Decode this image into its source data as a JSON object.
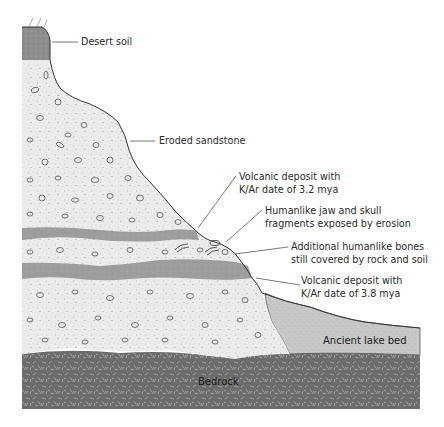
{
  "diagram": {
    "colors": {
      "desert_soil": "#8c8c8c",
      "sandstone": "#e8e8e8",
      "volcanic": "#9a9a9a",
      "lake_bed": "#c4c4c4",
      "bedrock": "#6e6e6e",
      "outline": "#3a3a3a",
      "label_text": "#2a2a2a"
    },
    "layers": [
      {
        "id": "desert-soil",
        "name": "Desert soil"
      },
      {
        "id": "sandstone",
        "name": "Eroded sandstone"
      },
      {
        "id": "volcanic-upper",
        "name": "Volcanic deposit",
        "date": "3.2 mya"
      },
      {
        "id": "volcanic-lower",
        "name": "Volcanic deposit",
        "date": "3.8 mya"
      },
      {
        "id": "lake-bed",
        "name": "Ancient lake bed"
      },
      {
        "id": "bedrock",
        "name": "Bedrock"
      }
    ]
  },
  "labels": {
    "desert_soil": "Desert soil",
    "eroded_sandstone": "Eroded sandstone",
    "volcanic_upper_l1": "Volcanic deposit with",
    "volcanic_upper_l2": "K/Ar date of 3.2 mya",
    "jaw_skull_l1": "Humanlike jaw and skull",
    "jaw_skull_l2": "fragments exposed by erosion",
    "additional_bones_l1": "Additional humanlike bones",
    "additional_bones_l2": "still covered by rock and soil",
    "volcanic_lower_l1": "Volcanic deposit with",
    "volcanic_lower_l2": "K/Ar date of 3.8 mya",
    "ancient_lake_bed": "Ancient lake bed",
    "bedrock": "Bedrock"
  }
}
